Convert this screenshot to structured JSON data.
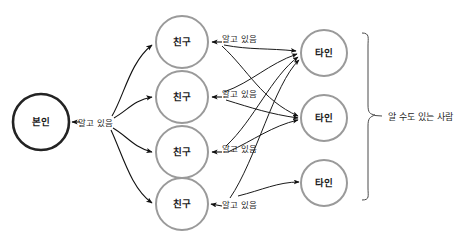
{
  "diagram": {
    "background_color": "#ffffff",
    "colors": {
      "self_node_stroke": "#232323",
      "friend_node_stroke": "#9a9a9a",
      "other_node_stroke": "#9a9a9a",
      "edge": "#111111",
      "brace": "#4a4a4a",
      "text": "#1f1f1f"
    },
    "nodes": {
      "self": [
        {
          "id": "self-1",
          "label": "본인",
          "cx": 41,
          "cy": 122,
          "r": 28,
          "stroke_width": 2.6
        }
      ],
      "friends": [
        {
          "id": "friend-1",
          "label": "친구",
          "cx": 182,
          "cy": 42,
          "r": 26,
          "stroke_width": 2.0
        },
        {
          "id": "friend-2",
          "label": "친구",
          "cx": 182,
          "cy": 97,
          "r": 26,
          "stroke_width": 2.0
        },
        {
          "id": "friend-3",
          "label": "친구",
          "cx": 182,
          "cy": 152,
          "r": 26,
          "stroke_width": 2.0
        },
        {
          "id": "friend-4",
          "label": "친구",
          "cx": 182,
          "cy": 204,
          "r": 26,
          "stroke_width": 2.0
        }
      ],
      "others": [
        {
          "id": "other-1",
          "label": "타인",
          "cx": 324,
          "cy": 53,
          "r": 23,
          "stroke_width": 2.0
        },
        {
          "id": "other-2",
          "label": "타인",
          "cx": 324,
          "cy": 118,
          "r": 23,
          "stroke_width": 2.0
        },
        {
          "id": "other-3",
          "label": "타인",
          "cx": 324,
          "cy": 183,
          "r": 23,
          "stroke_width": 2.0
        }
      ]
    },
    "edge_labels": {
      "self_to_friends": {
        "text": "알고 있음",
        "x": 78,
        "y": 123
      },
      "friend_to_others": [
        {
          "text": "알고 있음",
          "x": 222,
          "y": 39
        },
        {
          "text": "알고 있음",
          "x": 222,
          "y": 94
        },
        {
          "text": "알고 있음",
          "x": 222,
          "y": 149
        },
        {
          "text": "알고 있음",
          "x": 222,
          "y": 205
        }
      ]
    },
    "group": {
      "label": "알 수도 있는 사람",
      "label_x": 388,
      "label_y": 117,
      "brace_top": 33,
      "brace_bottom": 200,
      "brace_x": 368,
      "brace_tip_x": 381,
      "brace_tip_y": 116
    },
    "edges": {
      "self_to_friend_count": 4,
      "friend_to_other_count": 8,
      "relation_self_friend": "알고 있음",
      "relation_friend_other": "알고 있음"
    }
  }
}
